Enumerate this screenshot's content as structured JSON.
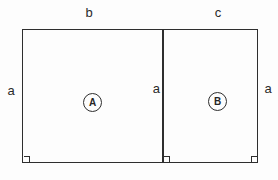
{
  "diagram": {
    "description_type": "geometry-figure",
    "labels": {
      "top_left_width": "b",
      "top_right_width": "c",
      "left_height": "a",
      "middle_height": "a",
      "right_height": "a"
    },
    "regions": [
      {
        "id": "A",
        "circle_label": "A",
        "width_label": "b",
        "height_label": "a"
      },
      {
        "id": "B",
        "circle_label": "B",
        "width_label": "c",
        "height_label": "a"
      }
    ],
    "colors": {
      "line": "#2e2e2e",
      "background": "#fdfdfd",
      "text": "#2a2a2a"
    }
  }
}
